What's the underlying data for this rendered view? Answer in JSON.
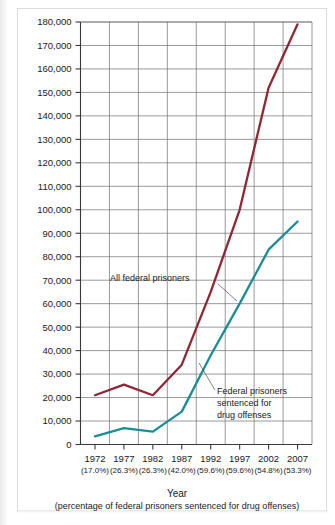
{
  "chart_data": {
    "type": "line",
    "title": "",
    "xlabel": "Year",
    "xlabel_sub": "(percentage of federal prisoners sentenced for drug offenses)",
    "ylabel": "",
    "ylim": [
      0,
      180000
    ],
    "ytick_step": 10000,
    "grid": true,
    "legend_position": "inline-annotation",
    "categories": [
      "1972",
      "1977",
      "1982",
      "1987",
      "1992",
      "1997",
      "2002",
      "2007"
    ],
    "category_sublabels": [
      "(17.0%)",
      "(26.3%)",
      "(26.3%)",
      "(42.0%)",
      "(59.6%)",
      "(59.6%)",
      "(54.8%)",
      "(53.3%)"
    ],
    "ytick_labels": [
      "180,000",
      "170,000",
      "160,000",
      "150,000",
      "140,000",
      "130,000",
      "120,000",
      "110,000",
      "100,000",
      "90,000",
      "80,000",
      "70,000",
      "60,000",
      "50,000",
      "40,000",
      "30,000",
      "20,000",
      "10,000",
      "0"
    ],
    "ytick_values": [
      180000,
      170000,
      160000,
      150000,
      140000,
      130000,
      120000,
      110000,
      100000,
      90000,
      80000,
      70000,
      60000,
      50000,
      40000,
      30000,
      20000,
      10000,
      0
    ],
    "series": [
      {
        "name": "All federal prisoners",
        "color": "#8e2736",
        "values": [
          21000,
          25500,
          21000,
          34000,
          65000,
          100000,
          152000,
          179000
        ]
      },
      {
        "name": "Federal prisoners sentenced for drug offenses",
        "color": "#1a8c96",
        "values": [
          3500,
          7000,
          5500,
          14000,
          38000,
          60000,
          83000,
          95000
        ]
      }
    ],
    "annotations": [
      {
        "name": "all-federal-prisoners-label",
        "text": "All federal prisoners",
        "lines": [
          "All federal prisoners"
        ]
      },
      {
        "name": "drug-offenses-label",
        "text": "Federal prisoners sentenced for drug offenses",
        "lines": [
          "Federal prisoners",
          "sentenced for",
          "drug offenses"
        ]
      }
    ]
  },
  "colors": {
    "all_prisoners_line": "#8e2736",
    "drug_offenses_line": "#1a8c96",
    "grid": "#6f6f6f",
    "axis": "#3a3a3a",
    "background": "#ffffff",
    "frame_border": "#dcdcdc"
  }
}
